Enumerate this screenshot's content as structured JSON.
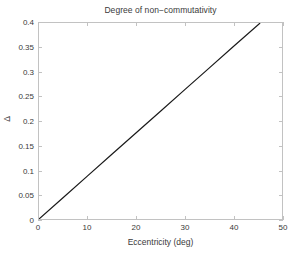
{
  "chart_data": {
    "type": "line",
    "title": "Degree of non−commutativity",
    "xlabel": "Eccentricity (deg)",
    "ylabel": "Δ",
    "xlim": [
      0,
      50
    ],
    "ylim": [
      0,
      0.4
    ],
    "grid": false,
    "legend": null,
    "xticks": [
      0,
      10,
      20,
      30,
      40,
      50
    ],
    "xtick_labels": [
      "0",
      "10",
      "20",
      "30",
      "40",
      "50"
    ],
    "yticks": [
      0,
      0.05,
      0.1,
      0.15,
      0.2,
      0.25,
      0.3,
      0.35,
      0.4
    ],
    "ytick_labels": [
      "0",
      "0.05",
      "0.1",
      "0.15",
      "0.2",
      "0.25",
      "0.3",
      "0.35",
      "0.4"
    ],
    "series": [
      {
        "name": "Delta vs eccentricity",
        "color": "#1a1a1a",
        "line_width": 1.2,
        "x": [
          0,
          5,
          10,
          15,
          20,
          25,
          30,
          35,
          40,
          45.5
        ],
        "y": [
          0,
          0.044,
          0.088,
          0.132,
          0.176,
          0.22,
          0.264,
          0.308,
          0.352,
          0.4
        ]
      }
    ]
  },
  "figure": {
    "background_color": "#ffffff",
    "axes_border_color": "#c2c2c2",
    "text_color": "#3a3a3a"
  }
}
